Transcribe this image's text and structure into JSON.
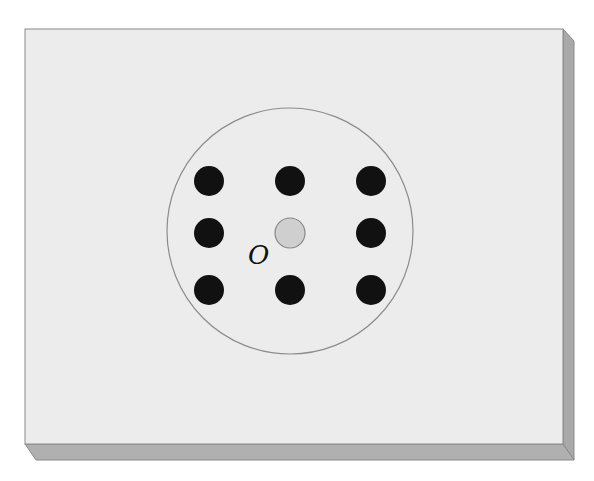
{
  "figure": {
    "label": "O",
    "colors": {
      "board_face": "#ececec",
      "board_edge": "#a9a9a9",
      "board_outline": "#8a8a8a",
      "circle_stroke": "#8c8c8c",
      "dot_fill": "#111111",
      "center_dot_fill": "#cfcfcf",
      "center_dot_stroke": "#888888"
    },
    "board": {
      "x": 25,
      "y": 29,
      "width": 538,
      "height": 415,
      "edge_depth": 12
    },
    "circle": {
      "cx": 290,
      "cy": 231,
      "r": 123
    },
    "dots": [
      {
        "cx": 209,
        "cy": 181
      },
      {
        "cx": 290,
        "cy": 181
      },
      {
        "cx": 371,
        "cy": 181
      },
      {
        "cx": 209,
        "cy": 233
      },
      {
        "cx": 371,
        "cy": 233
      },
      {
        "cx": 209,
        "cy": 290
      },
      {
        "cx": 290,
        "cy": 290
      },
      {
        "cx": 371,
        "cy": 290
      }
    ],
    "dot_radius": 15,
    "center_dot": {
      "cx": 290,
      "cy": 233,
      "r": 15
    }
  }
}
